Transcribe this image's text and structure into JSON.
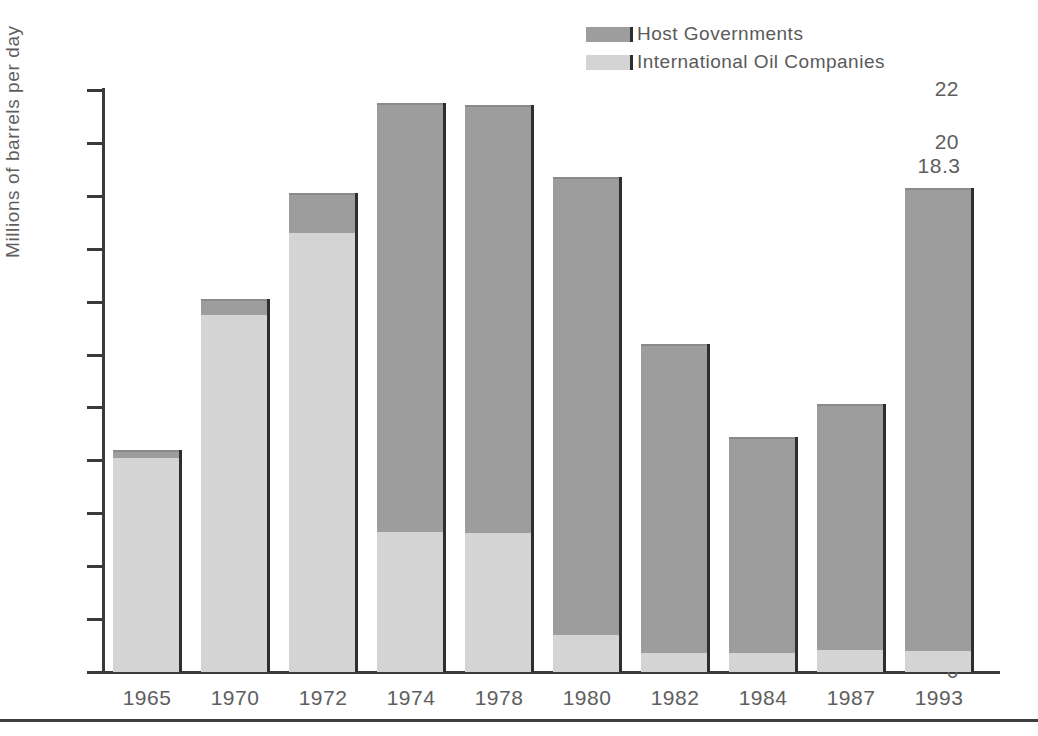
{
  "chart_data": {
    "type": "bar",
    "stacked": true,
    "title": "",
    "subtitle": "",
    "xlabel": "",
    "ylabel": "Millions of barrels per day",
    "ylim": [
      0,
      22
    ],
    "ytick_step": 2,
    "yticks": [
      "22",
      "20",
      "18",
      "16",
      "14",
      "12",
      "10",
      "8",
      "6",
      "4",
      "2",
      "0"
    ],
    "grid": false,
    "legend_position": "top-right",
    "categories": [
      "1965",
      "1970",
      "1972",
      "1974",
      "1978",
      "1980",
      "1982",
      "1984",
      "1987",
      "1993"
    ],
    "series": [
      {
        "name": "Host Governments",
        "color": "#9d9d9d",
        "values": [
          0.3,
          0.6,
          1.5,
          16.2,
          16.2,
          17.3,
          11.7,
          8.2,
          9.3,
          17.5
        ]
      },
      {
        "name": "International Oil Companies",
        "color": "#d4d4d4",
        "values": [
          8.1,
          13.5,
          16.6,
          5.3,
          5.25,
          1.4,
          0.7,
          0.7,
          0.85,
          0.8
        ]
      }
    ],
    "totals": [
      8.4,
      14.1,
      18.1,
      21.5,
      21.45,
      18.7,
      12.4,
      8.9,
      10.15,
      18.3
    ],
    "annotations": [
      {
        "category": "1993",
        "text": "18.3"
      }
    ]
  },
  "legend": {
    "items": [
      {
        "label": "Host Governments",
        "swatch": "host"
      },
      {
        "label": "International Oil Companies",
        "swatch": "ioc"
      }
    ]
  },
  "colors": {
    "host_governments": "#9d9d9d",
    "international_oil_companies": "#d4d4d4",
    "axis": "#3a3a3a",
    "text": "#5e5e5e",
    "background": "#ffffff"
  }
}
